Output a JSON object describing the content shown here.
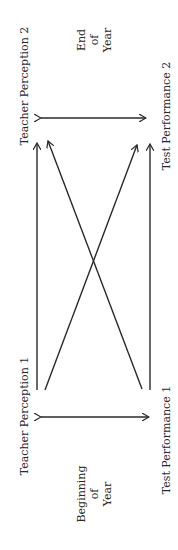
{
  "diagram": {
    "nodes": {
      "teacher_perception_1": "Teacher Perception 1",
      "teacher_perception_2": "Teacher Perception 2",
      "test_performance_1": "Test Performance 1",
      "test_performance_2": "Test Performance 2"
    },
    "time_labels": {
      "end": [
        "End",
        "of",
        "Year"
      ],
      "beginning": [
        "Beginning",
        "of",
        "Year"
      ]
    },
    "edges": [
      {
        "from": "Teacher Perception 1",
        "to": "Teacher Perception 2",
        "type": "arrow"
      },
      {
        "from": "Test Performance 1",
        "to": "Test Performance 2",
        "type": "arrow"
      },
      {
        "from": "Teacher Perception 1",
        "to": "Test Performance 2",
        "type": "arrow"
      },
      {
        "from": "Test Performance 1",
        "to": "Teacher Perception 2",
        "type": "arrow"
      },
      {
        "from": "Teacher Perception 1",
        "to": "Test Performance 1",
        "type": "double-arrow"
      },
      {
        "from": "Teacher Perception 2",
        "to": "Test Performance 2",
        "type": "double-arrow"
      }
    ]
  }
}
